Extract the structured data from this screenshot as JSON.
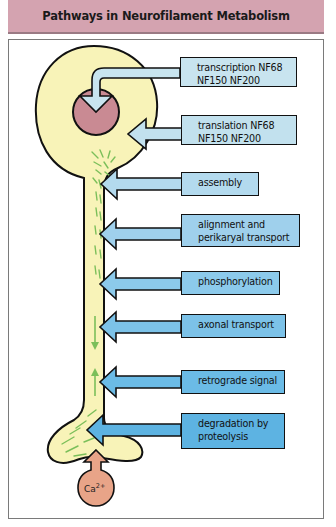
{
  "header": {
    "title": "Pathways in Neurofilament Metabolism"
  },
  "colors": {
    "header_bg": "#d4a3b0",
    "cell_body": "#f8f3b8",
    "nucleus": "#c98a93",
    "calcium": "#e8a488",
    "filament_green": "#7bbf5a"
  },
  "pathways": [
    {
      "id": "transcription",
      "lines": [
        "transcription  NF68",
        "NF150  NF200"
      ],
      "color": "#c8e4ef"
    },
    {
      "id": "translation",
      "lines": [
        "translation  NF68",
        "NF150  NF200"
      ],
      "color": "#c2e1ee"
    },
    {
      "id": "assembly",
      "lines": [
        "assembly"
      ],
      "color": "#b3daee"
    },
    {
      "id": "alignment",
      "lines": [
        "alignment and",
        "perikaryal transport"
      ],
      "color": "#9fd0ec"
    },
    {
      "id": "phosphorylation",
      "lines": [
        "phosphorylation"
      ],
      "color": "#8ccaeb"
    },
    {
      "id": "axonal-transport",
      "lines": [
        "axonal transport"
      ],
      "color": "#7cc2e8"
    },
    {
      "id": "retrograde-signal",
      "lines": [
        "retrograde signal"
      ],
      "color": "#6bbbe6"
    },
    {
      "id": "degradation",
      "lines": [
        "degradation by",
        "proteolysis"
      ],
      "color": "#5db3e2"
    }
  ],
  "calcium": {
    "label": "Ca",
    "superscript": "2+"
  }
}
